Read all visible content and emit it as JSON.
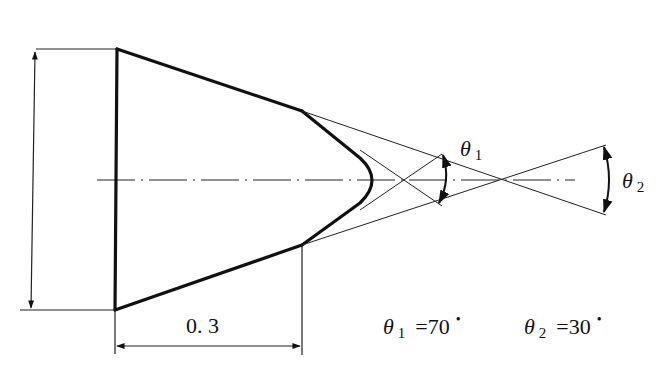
{
  "diagram": {
    "type": "technical-drawing",
    "colors": {
      "ink": "#111111",
      "background": "#ffffff"
    },
    "labels": {
      "theta1_symbol": "θ",
      "theta1_sub": "1",
      "theta2_symbol": "θ",
      "theta2_sub": "2",
      "length_dimension": "0. 3"
    },
    "legend": {
      "theta1_symbol": "θ",
      "theta1_sub": "1",
      "theta1_value": "=70",
      "theta1_unit": "•",
      "theta2_symbol": "θ",
      "theta2_sub": "2",
      "theta2_value": "=30",
      "theta2_unit": "•"
    },
    "parameters": {
      "theta1_deg": 70,
      "theta2_deg": 30,
      "cone_section_length": 0.3
    }
  }
}
